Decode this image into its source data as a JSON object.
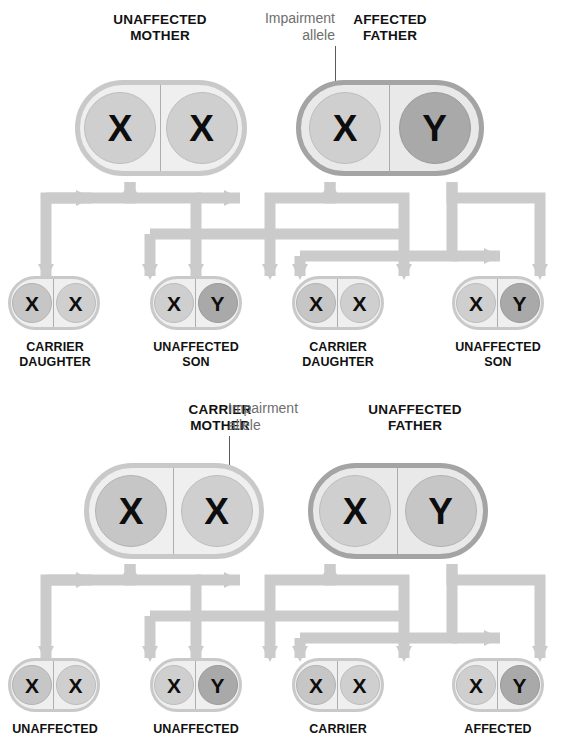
{
  "diagram": {
    "allele_symbols": {
      "x": "X",
      "y": "Y"
    },
    "colors": {
      "shell_light_fill": "#efefef",
      "shell_light_border": "#c9c9c9",
      "shell_dark_fill": "#e9e9e9",
      "shell_dark_border": "#a4a4a4",
      "allele_light": "#cfcfcf",
      "allele_mid": "#c6c6c6",
      "allele_dark": "#a9a9a9",
      "arrow": "#c9c9c9",
      "label_text": "#111111",
      "callout_text": "#6e6e6e",
      "leader_line": "#5a5a5a"
    }
  },
  "panels": [
    {
      "id": "affected-father",
      "callout": {
        "text": "Impairment\nallele"
      },
      "parents": [
        {
          "label": "UNAFFECTED\nMOTHER",
          "shell": "light",
          "alleles": [
            {
              "symbol": "X",
              "tone": "light"
            },
            {
              "symbol": "X",
              "tone": "light"
            }
          ]
        },
        {
          "label": "AFFECTED\nFATHER",
          "shell": "dark",
          "alleles": [
            {
              "symbol": "X",
              "tone": "light"
            },
            {
              "symbol": "Y",
              "tone": "dark"
            }
          ]
        }
      ],
      "children": [
        {
          "label": "CARRIER\nDAUGHTER",
          "shell": "light",
          "alleles": [
            {
              "symbol": "X",
              "tone": "mid"
            },
            {
              "symbol": "X",
              "tone": "light"
            }
          ]
        },
        {
          "label": "UNAFFECTED\nSON",
          "shell": "light",
          "alleles": [
            {
              "symbol": "X",
              "tone": "light"
            },
            {
              "symbol": "Y",
              "tone": "dark"
            }
          ]
        },
        {
          "label": "CARRIER\nDAUGHTER",
          "shell": "light",
          "alleles": [
            {
              "symbol": "X",
              "tone": "mid"
            },
            {
              "symbol": "X",
              "tone": "light"
            }
          ]
        },
        {
          "label": "UNAFFECTED\nSON",
          "shell": "light",
          "alleles": [
            {
              "symbol": "X",
              "tone": "light"
            },
            {
              "symbol": "Y",
              "tone": "dark"
            }
          ]
        }
      ]
    },
    {
      "id": "carrier-mother",
      "callout": {
        "text": "Impairment\nallele"
      },
      "parents": [
        {
          "label": "CARRIER\nMOTHER",
          "shell": "light",
          "alleles": [
            {
              "symbol": "X",
              "tone": "mid"
            },
            {
              "symbol": "X",
              "tone": "light"
            }
          ]
        },
        {
          "label": "UNAFFECTED\nFATHER",
          "shell": "dark",
          "alleles": [
            {
              "symbol": "X",
              "tone": "light"
            },
            {
              "symbol": "Y",
              "tone": "mid"
            }
          ]
        }
      ],
      "children": [
        {
          "label": "UNAFFECTED",
          "shell": "light",
          "alleles": [
            {
              "symbol": "X",
              "tone": "mid"
            },
            {
              "symbol": "X",
              "tone": "light"
            }
          ]
        },
        {
          "label": "UNAFFECTED",
          "shell": "light",
          "alleles": [
            {
              "symbol": "X",
              "tone": "light"
            },
            {
              "symbol": "Y",
              "tone": "dark"
            }
          ]
        },
        {
          "label": "CARRIER",
          "shell": "light",
          "alleles": [
            {
              "symbol": "X",
              "tone": "mid"
            },
            {
              "symbol": "X",
              "tone": "light"
            }
          ]
        },
        {
          "label": "AFFECTED",
          "shell": "light",
          "alleles": [
            {
              "symbol": "X",
              "tone": "light"
            },
            {
              "symbol": "Y",
              "tone": "dark"
            }
          ]
        }
      ]
    }
  ]
}
